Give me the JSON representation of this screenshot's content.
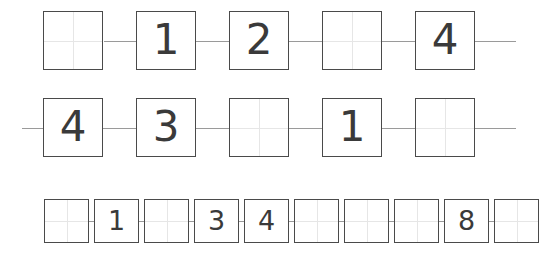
{
  "worksheet": {
    "title": "number-sequence-boxes-worksheet",
    "background_color": "#ffffff",
    "box_border_color": "#4a4a4a",
    "guide_line_color": "#e6e6e6",
    "connector_color": "#9a9a9a",
    "digit_color": "#3a3a3a",
    "rows": [
      {
        "name": "row-1",
        "y": 11,
        "box_size": 60,
        "box_height": 59,
        "gap": 33,
        "start_x": 43,
        "rail": {
          "x": 104,
          "width": 412
        },
        "cells": [
          {
            "value": "",
            "empty": true
          },
          {
            "value": "1",
            "empty": false
          },
          {
            "value": "2",
            "empty": false
          },
          {
            "value": "",
            "empty": true
          },
          {
            "value": "4",
            "empty": false
          }
        ]
      },
      {
        "name": "row-2",
        "y": 98,
        "box_size": 60,
        "box_height": 59,
        "gap": 33,
        "start_x": 43,
        "rail": {
          "x": 22,
          "width": 494
        },
        "cells": [
          {
            "value": "4",
            "empty": false
          },
          {
            "value": "3",
            "empty": false
          },
          {
            "value": "",
            "empty": true
          },
          {
            "value": "1",
            "empty": false
          },
          {
            "value": "",
            "empty": true
          }
        ]
      },
      {
        "name": "row-3",
        "y": 199,
        "box_size": 45,
        "box_height": 44,
        "gap": 5,
        "start_x": 44,
        "rail": {
          "x": 44,
          "width": 458
        },
        "cells": [
          {
            "value": "",
            "empty": true
          },
          {
            "value": "1",
            "empty": false
          },
          {
            "value": "",
            "empty": true
          },
          {
            "value": "3",
            "empty": false
          },
          {
            "value": "4",
            "empty": false
          },
          {
            "value": "",
            "empty": true
          },
          {
            "value": "",
            "empty": true
          },
          {
            "value": "",
            "empty": true
          },
          {
            "value": "8",
            "empty": false
          },
          {
            "value": "",
            "empty": true
          }
        ]
      }
    ]
  }
}
